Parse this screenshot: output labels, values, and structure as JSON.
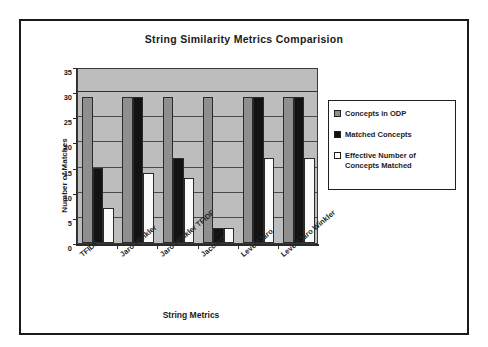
{
  "figure": {
    "title": "String Similarity Metrics Comparision"
  },
  "axes": {
    "y_title": "Number of Matches",
    "x_title": "String Metrics"
  },
  "legend": {
    "items": [
      {
        "label": "Concepts in ODP",
        "swatch": "legend-swatch-gray",
        "color": "#8f8f8f"
      },
      {
        "label": "Matched Concepts",
        "swatch": "legend-swatch-black",
        "color": "#111111"
      },
      {
        "label": "Effective Number of Concepts Matched",
        "swatch": "legend-swatch-white",
        "color": "#ffffff"
      }
    ]
  },
  "chart_data": {
    "type": "bar",
    "title": "String Similarity Metrics Comparision",
    "xlabel": "String Metrics",
    "ylabel": "Number of Matches",
    "ylim": [
      0,
      35
    ],
    "yticks": [
      0,
      5,
      10,
      15,
      20,
      25,
      30,
      35
    ],
    "ytick_labels": [
      "0",
      "5",
      "10",
      "15",
      "20",
      "25",
      "30",
      "35"
    ],
    "grid": true,
    "legend_position": "right",
    "plot_background": "#bdbdbd",
    "categories": [
      "TFIDF",
      "Jaro Winkler",
      "Jaro Winkler TFIDF",
      "Jaccard",
      "Level2Jaro",
      "Level2Jaro Winkler"
    ],
    "series": [
      {
        "name": "Concepts in ODP",
        "color": "#8f8f8f",
        "values": [
          29,
          29,
          29,
          29,
          29,
          29
        ]
      },
      {
        "name": "Matched Concepts",
        "color": "#111111",
        "values": [
          15,
          29,
          17,
          3,
          29,
          29
        ]
      },
      {
        "name": "Effective Number of Concepts Matched",
        "color": "#ffffff",
        "values": [
          7,
          14,
          13,
          3,
          17,
          17
        ]
      }
    ]
  }
}
